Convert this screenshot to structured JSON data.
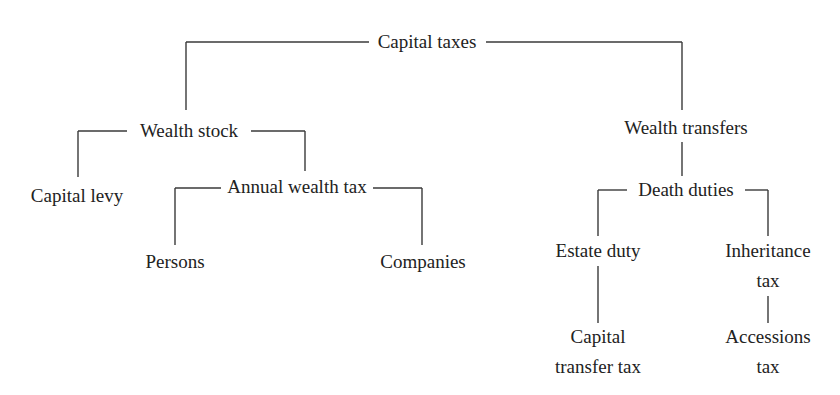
{
  "diagram": {
    "type": "tree",
    "title": "Capital taxes",
    "nodes": {
      "root": {
        "label": "Capital taxes"
      },
      "wealth_stock": {
        "label": "Wealth stock"
      },
      "wealth_transfers": {
        "label": "Wealth transfers"
      },
      "capital_levy": {
        "label": "Capital levy"
      },
      "annual_wealth_tax": {
        "label": "Annual wealth tax"
      },
      "persons": {
        "label": "Persons"
      },
      "companies": {
        "label": "Companies"
      },
      "death_duties": {
        "label": "Death duties"
      },
      "estate_duty": {
        "label": "Estate duty"
      },
      "inheritance_tax": {
        "line1": "Inheritance",
        "line2": "tax"
      },
      "capital_transfer_tax": {
        "line1": "Capital",
        "line2": "transfer tax"
      },
      "accessions_tax": {
        "line1": "Accessions",
        "line2": "tax"
      }
    },
    "edges": [
      [
        "Capital taxes",
        "Wealth stock"
      ],
      [
        "Capital taxes",
        "Wealth transfers"
      ],
      [
        "Wealth stock",
        "Capital levy"
      ],
      [
        "Wealth stock",
        "Annual wealth tax"
      ],
      [
        "Annual wealth tax",
        "Persons"
      ],
      [
        "Annual wealth tax",
        "Companies"
      ],
      [
        "Wealth transfers",
        "Death duties"
      ],
      [
        "Death duties",
        "Estate duty"
      ],
      [
        "Death duties",
        "Inheritance tax"
      ],
      [
        "Estate duty",
        "Capital transfer tax"
      ],
      [
        "Inheritance tax",
        "Accessions tax"
      ]
    ],
    "colors": {
      "text": "#222222",
      "line": "#3a3a3a",
      "background": "#ffffff"
    }
  }
}
